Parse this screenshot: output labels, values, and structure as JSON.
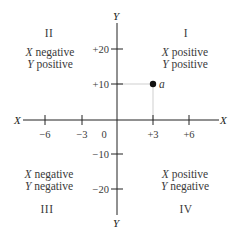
{
  "diagram": {
    "type": "cartesian-coordinate-plane",
    "axes": {
      "x_label_left": "X",
      "x_label_right": "X",
      "y_label_top": "Y",
      "y_label_bottom": "Y"
    },
    "x_ticks": [
      {
        "label": "−6",
        "value": -6
      },
      {
        "label": "−3",
        "value": -3
      },
      {
        "label": "+3",
        "value": 3
      },
      {
        "label": "+6",
        "value": 6
      }
    ],
    "origin_label": "0",
    "y_ticks": [
      {
        "label": "+20",
        "value": 20
      },
      {
        "label": "+10",
        "value": 10
      },
      {
        "label": "−10",
        "value": -10
      },
      {
        "label": "−20",
        "value": -20
      }
    ],
    "quadrants": [
      {
        "numeral": "I",
        "x_var": "X",
        "x_desc": " positive",
        "y_var": "Y",
        "y_desc": " positive"
      },
      {
        "numeral": "II",
        "x_var": "X",
        "x_desc": " negative",
        "y_var": "Y",
        "y_desc": " positive"
      },
      {
        "numeral": "III",
        "x_var": "X",
        "x_desc": " negative",
        "y_var": "Y",
        "y_desc": " negative"
      },
      {
        "numeral": "IV",
        "x_var": "X",
        "x_desc": " positive",
        "y_var": "Y",
        "y_desc": " negative"
      }
    ],
    "point": {
      "label": "a",
      "x": 3,
      "y": 10
    },
    "colors": {
      "axis": "#222222",
      "guide": "#c8c8c8",
      "point": "#111111",
      "text": "#3a3a3a"
    }
  }
}
